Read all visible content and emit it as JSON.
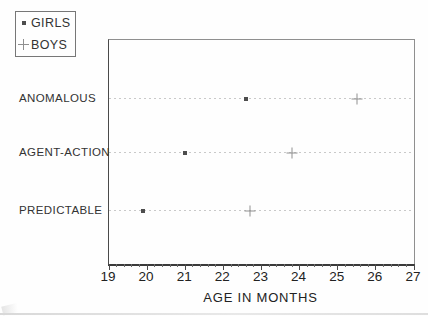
{
  "legend": {
    "items": [
      {
        "label": "GIRLS",
        "marker": "dot"
      },
      {
        "label": "BOYS",
        "marker": "plus"
      }
    ]
  },
  "chart_data": {
    "type": "scatter",
    "title": "",
    "categories": [
      "ANOMALOUS",
      "AGENT-ACTION",
      "PREDICTABLE"
    ],
    "series": [
      {
        "name": "GIRLS",
        "marker": "dot",
        "values": [
          22.6,
          21.0,
          19.9
        ]
      },
      {
        "name": "BOYS",
        "marker": "plus",
        "values": [
          25.5,
          23.8,
          22.7
        ]
      }
    ],
    "xlabel": "AGE IN MONTHS",
    "ylabel": "",
    "xlim": [
      19,
      27
    ],
    "x_major_ticks": [
      19,
      20,
      21,
      22,
      23,
      24,
      25,
      26,
      27
    ],
    "x_minor_step": 0.2,
    "grid": "horizontal dotted line per category",
    "legend_position": "outside top-left"
  },
  "colors": {
    "background": "#fefefe",
    "axis": "#3a3a3a",
    "box_border": "#8f8f8f",
    "gridline": "#c9c9c9",
    "girls_marker": "#4d4d4d",
    "boys_marker": "#8f8f8f",
    "text": "#2e2e2e"
  }
}
